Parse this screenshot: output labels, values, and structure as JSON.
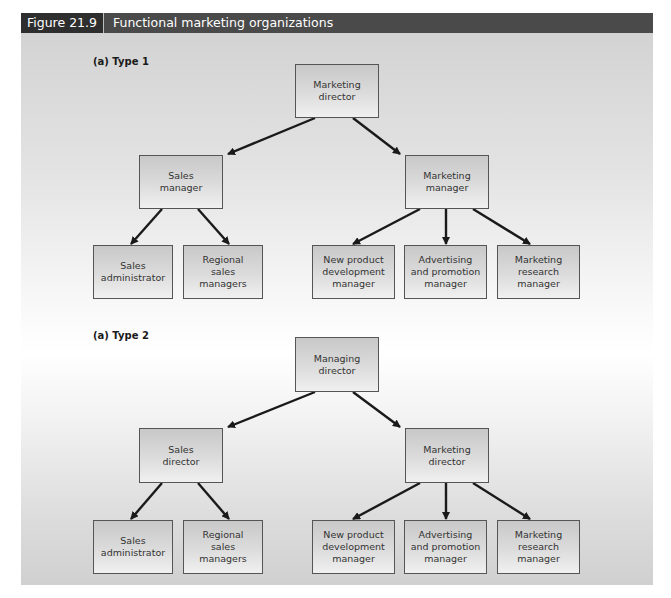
{
  "figure": {
    "number": "Figure 21.9",
    "title": "Functional marketing organizations"
  },
  "type1": {
    "label": "(a) Type 1",
    "top": "Marketing\ndirector",
    "left_mid": "Sales\nmanager",
    "right_mid": "Marketing\nmanager",
    "left_children": [
      "Sales\nadministrator",
      "Regional\nsales\nmanagers"
    ],
    "right_children": [
      "New product\ndevelopment\nmanager",
      "Advertising\nand promotion\nmanager",
      "Marketing\nresearch\nmanager"
    ]
  },
  "type2": {
    "label": "(a) Type 2",
    "top": "Managing\ndirector",
    "left_mid": "Sales\ndirector",
    "right_mid": "Marketing\ndirector",
    "left_children": [
      "Sales\nadministrator",
      "Regional\nsales\nmanagers"
    ],
    "right_children": [
      "New product\ndevelopment\nmanager",
      "Advertising\nand promotion\nmanager",
      "Marketing\nresearch\nmanager"
    ]
  },
  "colors": {
    "header_bg": "#4a4a4a",
    "header_num_bg": "#2e2e2e",
    "box_border": "#555555",
    "arrow": "#1a1a1a"
  }
}
